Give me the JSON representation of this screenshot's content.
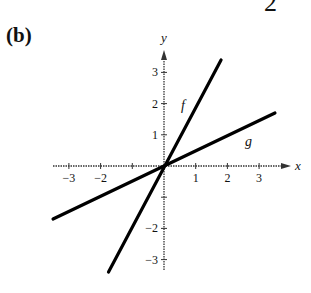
{
  "page": {
    "part_label": "(b)",
    "top_fragment": "2"
  },
  "chart_data": {
    "type": "line",
    "title": "",
    "xlabel": "x",
    "ylabel": "y",
    "xlim": [
      -3.5,
      3.6
    ],
    "ylim": [
      -3.4,
      3.6
    ],
    "x_ticks": [
      -3,
      -2,
      -1,
      1,
      2,
      3
    ],
    "x_tick_labels": [
      "−3",
      "−2",
      "",
      "1",
      "2",
      "3"
    ],
    "y_ticks": [
      -3,
      -2,
      -1,
      1,
      2,
      3
    ],
    "y_tick_labels": [
      "−3",
      "−2",
      "",
      "1",
      "2",
      "3"
    ],
    "grid": false,
    "series": [
      {
        "name": "f",
        "x": [
          -1.75,
          1.8
        ],
        "y": [
          -3.4,
          3.4
        ],
        "slope": 2
      },
      {
        "name": "g",
        "x": [
          -3.5,
          3.5
        ],
        "y": [
          -1.7,
          1.7
        ],
        "slope": 0.5
      }
    ]
  }
}
